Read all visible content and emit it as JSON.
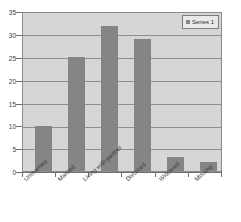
{
  "chart_data": {
    "type": "bar",
    "title": "",
    "xlabel": "",
    "ylabel": "",
    "categories": [
      "Unmarried",
      "Married",
      "Living with partner",
      "Divorced",
      "Widowed",
      "Missing"
    ],
    "values": [
      10,
      25,
      32,
      29,
      3,
      2
    ],
    "series": [
      {
        "name": "Series 1",
        "values": [
          10,
          25,
          32,
          29,
          3,
          2
        ]
      }
    ],
    "ylim": [
      0,
      35
    ],
    "ytick_labels": [
      "0",
      "5",
      "10",
      "15",
      "20",
      "25",
      "30",
      "35"
    ],
    "ytick_values": [
      0,
      5,
      10,
      15,
      20,
      25,
      30,
      35
    ],
    "grid": true,
    "legend_position": "top-right",
    "colors": {
      "bar": "#858585",
      "plot_background": "#d6d6d6",
      "gridline": "#8f8f8f",
      "axis": "#6f6f6f",
      "legend_background": "#e9e9e9",
      "legend_border": "#7d7d7d",
      "text": "#3a3a3a"
    }
  },
  "legend": {
    "entries": [
      {
        "label": "Series 1",
        "swatch": "legend-swatch-icon"
      }
    ]
  }
}
